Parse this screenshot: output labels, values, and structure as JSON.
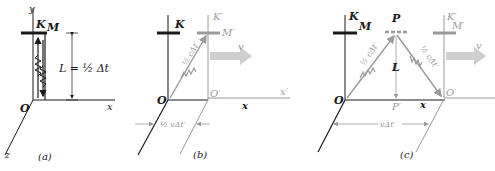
{
  "colors": {
    "ink": "#1a1a1a",
    "moving_frame": "#9a9a9a",
    "velocity_arrow": "#cfcfcf"
  },
  "panel_a": {
    "caption": "(a)",
    "axis_y": "y",
    "axis_x": "x",
    "axis_z": "z",
    "frame": "K",
    "mirror": "M",
    "origin": "O",
    "length_label": "L = ½ Δt"
  },
  "panel_b": {
    "caption": "(b)",
    "frame": "K",
    "frame_moving": "K′",
    "mirror_moving": "M′",
    "origin": "O",
    "origin_moving": "O′",
    "axis_x": "x",
    "axis_x_moving": "x′",
    "velocity": "v",
    "path_label": "½ cΔt′",
    "displacement_label": "½ vΔt′"
  },
  "panel_c": {
    "caption": "(c)",
    "frame": "K",
    "mirror": "M",
    "point_p": "P",
    "point_p_prime": "P′",
    "frame_moving": "K′",
    "mirror_moving": "M′",
    "origin": "O",
    "origin_moving": "O′",
    "axis_x": "x",
    "velocity": "v",
    "length": "L",
    "path_up_label": "½ cΔt′",
    "path_down_label": "½ cΔt′",
    "displacement_label": "vΔt′"
  }
}
